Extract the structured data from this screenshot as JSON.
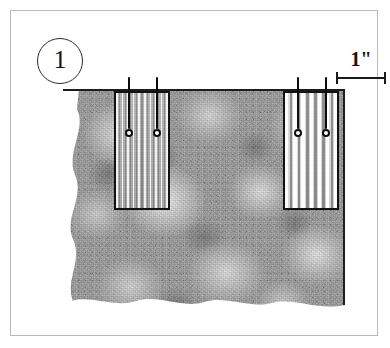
{
  "figure": {
    "step_number": "1",
    "caption": ""
  },
  "scale": {
    "label": "1\"",
    "unit": "inch",
    "value": 1,
    "icon": "dimension-line-icon",
    "bar_length_px": 50
  },
  "ground_fabric": {
    "name": "floral-print-background-fabric",
    "pattern": "mottled large-scale floral blobs, grayscale",
    "base_color": "#a7a7a7",
    "highlight_color": "#efefef",
    "shadow_color": "#606060",
    "edges": {
      "top": "straight inked rule",
      "right": "straight inked rule",
      "left": "wavy torn edge",
      "bottom": "scalloped wavy edge"
    }
  },
  "swatches": [
    {
      "id": "swatch-left",
      "name": "left-striped-swatch",
      "stripe_style": "fine pinstripe",
      "stripe_color_light": "#ffffff",
      "stripe_color_dark": "#6c6c6c",
      "base_color": "#b3b3b3",
      "border_color": "#121212",
      "pins": 2
    },
    {
      "id": "swatch-right",
      "name": "right-striped-swatch",
      "stripe_style": "bold wide stripe",
      "stripe_color_light": "#ffffff",
      "stripe_color_dark": "#848484",
      "base_color": "#9c9c9c",
      "border_color": "#121212",
      "pins": 2
    }
  ],
  "pins": {
    "icon": "straight-pin-icon",
    "shaft_color": "#0d0d0d",
    "head_fill": "#ffffff",
    "head_stroke": "#0d0d0d"
  },
  "frame": {
    "border_color": "#b9b9b9",
    "background": "#ffffff"
  }
}
